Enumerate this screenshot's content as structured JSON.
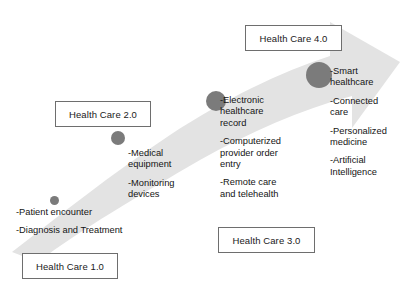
{
  "diagram": {
    "title_visible": false,
    "background_color": "#ffffff",
    "band_color": "#e3e3e3",
    "node_color": "#7b7b7b",
    "stages": [
      {
        "id": "hc1",
        "label": "Health Care 1.0",
        "node_size_px": 9,
        "features": [
          "-Patient encounter",
          "-Diagnosis and Treatment"
        ]
      },
      {
        "id": "hc2",
        "label": "Health Care 2.0",
        "node_size_px": 14,
        "features": [
          "-Medical",
          "equipment",
          "-Monitoring",
          "devices"
        ],
        "feature_lines": [
          [
            "-Medical",
            "equipment"
          ],
          [
            "-Monitoring",
            "devices"
          ]
        ]
      },
      {
        "id": "hc3",
        "label": "Health Care 3.0",
        "node_size_px": 20,
        "feature_lines": [
          [
            "-Electronic",
            "healthcare",
            "record"
          ],
          [
            "-Computerized",
            "provider order",
            "entry"
          ],
          [
            "-Remote care",
            "and telehealth"
          ]
        ]
      },
      {
        "id": "hc4",
        "label": "Health Care 4.0",
        "node_size_px": 26,
        "feature_lines": [
          [
            "-Smart",
            "healthcare"
          ],
          [
            "-Connected",
            "care"
          ],
          [
            "-Personalized",
            "medicine"
          ],
          [
            "-Artificial",
            "Intelligence"
          ]
        ]
      }
    ]
  }
}
